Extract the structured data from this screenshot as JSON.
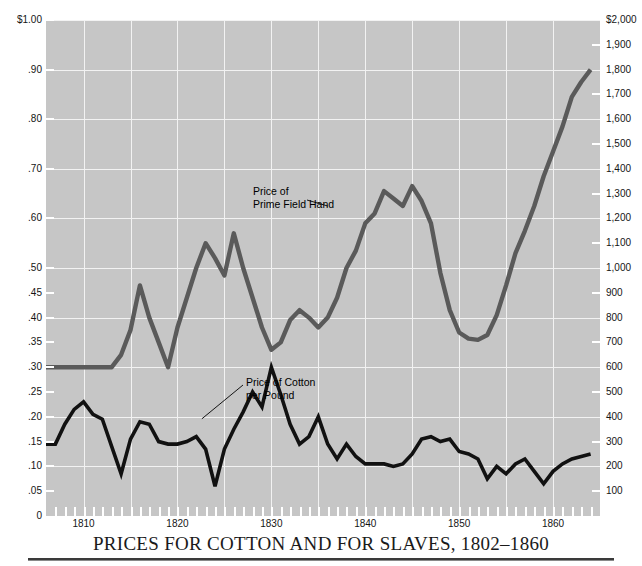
{
  "chart": {
    "title": "PRICES FOR COTTON AND FOR SLAVES, 1802–1860",
    "left_axis_title": "",
    "right_axis_title": "",
    "left_ticks": [
      "$1.00",
      ".90",
      ".80",
      ".70",
      ".60",
      ".50",
      ".45",
      ".40",
      ".35",
      ".30",
      ".25",
      ".20",
      ".15",
      ".10",
      ".05",
      "0"
    ],
    "right_ticks": [
      "$2,000",
      "1,900",
      "1,800",
      "1,700",
      "1,600",
      "1,500",
      "1,400",
      "1,300",
      "1,200",
      "1,100",
      "1,000",
      "900",
      "800",
      "700",
      "600",
      "500",
      "400",
      "300",
      "200",
      "100"
    ],
    "x_ticks": [
      "1810",
      "1820",
      "1830",
      "1840",
      "1850",
      "1860"
    ],
    "annotation_slaves_line1": "Price of",
    "annotation_slaves_line2": "Prime Field Hand",
    "annotation_cotton_line1": "Price of Cotton",
    "annotation_cotton_line2": "per Pound",
    "colors": {
      "panel": "#c6c6c6",
      "grid": "#f2f2f2",
      "cotton_line": "#111111",
      "slave_line": "#5a5a5a",
      "text": "#151515"
    }
  },
  "chart_data": {
    "type": "line",
    "title": "PRICES FOR COTTON AND FOR SLAVES, 1802–1860",
    "xlabel": "Year",
    "ylabel": "Price of Cotton per Pound (dollars)",
    "y2label": "Price of Prime Field Hand (dollars)",
    "xlim": [
      1806,
      1865
    ],
    "ylim": [
      0,
      1.0
    ],
    "y2lim": [
      0,
      2000
    ],
    "grid": true,
    "legend": "inline-annotations",
    "x_tick_labels": [
      "1810",
      "1820",
      "1830",
      "1840",
      "1850",
      "1860"
    ],
    "x_tick_values": [
      1810,
      1820,
      1830,
      1840,
      1850,
      1860
    ],
    "y_tick_labels": [
      "$1.00",
      ".90",
      ".80",
      ".70",
      ".60",
      ".50",
      ".45",
      ".40",
      ".35",
      ".30",
      ".25",
      ".20",
      ".15",
      ".10",
      ".05",
      "0"
    ],
    "y_tick_values": [
      1.0,
      0.9,
      0.8,
      0.7,
      0.6,
      0.5,
      0.45,
      0.4,
      0.35,
      0.3,
      0.25,
      0.2,
      0.15,
      0.1,
      0.05,
      0
    ],
    "y2_tick_labels": [
      "$2,000",
      "1,900",
      "1,800",
      "1,700",
      "1,600",
      "1,500",
      "1,400",
      "1,300",
      "1,200",
      "1,100",
      "1,000",
      "900",
      "800",
      "700",
      "600",
      "500",
      "400",
      "300",
      "200",
      "100"
    ],
    "y2_tick_values": [
      2000,
      1900,
      1800,
      1700,
      1600,
      1500,
      1400,
      1300,
      1200,
      1100,
      1000,
      900,
      800,
      700,
      600,
      500,
      400,
      300,
      200,
      100
    ],
    "series": [
      {
        "name": "Price of Cotton per Pound",
        "axis": "left",
        "unit": "dollars per pound",
        "color": "#111111",
        "x": [
          1806,
          1807,
          1808,
          1809,
          1810,
          1811,
          1812,
          1813,
          1814,
          1815,
          1816,
          1817,
          1818,
          1819,
          1820,
          1821,
          1822,
          1823,
          1824,
          1825,
          1826,
          1827,
          1828,
          1829,
          1830,
          1831,
          1832,
          1833,
          1834,
          1835,
          1836,
          1837,
          1838,
          1839,
          1840,
          1841,
          1842,
          1843,
          1844,
          1845,
          1846,
          1847,
          1848,
          1849,
          1850,
          1851,
          1852,
          1853,
          1854,
          1855,
          1856,
          1857,
          1858,
          1859,
          1860,
          1861,
          1862,
          1863,
          1864
        ],
        "y": [
          0.145,
          0.145,
          0.185,
          0.215,
          0.23,
          0.205,
          0.195,
          0.14,
          0.085,
          0.155,
          0.19,
          0.185,
          0.15,
          0.145,
          0.145,
          0.15,
          0.16,
          0.135,
          0.06,
          0.135,
          0.175,
          0.21,
          0.25,
          0.22,
          0.3,
          0.245,
          0.185,
          0.145,
          0.16,
          0.2,
          0.145,
          0.115,
          0.145,
          0.12,
          0.105,
          0.105,
          0.105,
          0.1,
          0.105,
          0.125,
          0.155,
          0.16,
          0.15,
          0.155,
          0.13,
          0.125,
          0.115,
          0.075,
          0.1,
          0.085,
          0.105,
          0.115,
          0.09,
          0.065,
          0.09,
          0.105,
          0.115,
          0.12,
          0.125
        ]
      },
      {
        "name": "Price of Prime Field Hand",
        "axis": "right",
        "unit": "dollars",
        "color": "#5a5a5a",
        "x": [
          1806,
          1807,
          1808,
          1809,
          1810,
          1811,
          1812,
          1813,
          1814,
          1815,
          1816,
          1817,
          1818,
          1819,
          1820,
          1821,
          1822,
          1823,
          1824,
          1825,
          1826,
          1827,
          1828,
          1829,
          1830,
          1831,
          1832,
          1833,
          1834,
          1835,
          1836,
          1837,
          1838,
          1839,
          1840,
          1841,
          1842,
          1843,
          1844,
          1845,
          1846,
          1847,
          1848,
          1849,
          1850,
          1851,
          1852,
          1853,
          1854,
          1855,
          1856,
          1857,
          1858,
          1859,
          1860,
          1861,
          1862,
          1863,
          1864
        ],
        "y": [
          600,
          600,
          600,
          600,
          600,
          600,
          600,
          600,
          650,
          750,
          930,
          800,
          700,
          600,
          760,
          880,
          1000,
          1100,
          1040,
          970,
          1140,
          1000,
          880,
          760,
          670,
          700,
          790,
          830,
          800,
          760,
          800,
          880,
          1000,
          1070,
          1180,
          1220,
          1310,
          1280,
          1250,
          1330,
          1270,
          1180,
          980,
          830,
          740,
          715,
          710,
          730,
          810,
          930,
          1060,
          1150,
          1250,
          1370,
          1470,
          1570,
          1690,
          1750,
          1800
        ]
      }
    ]
  }
}
